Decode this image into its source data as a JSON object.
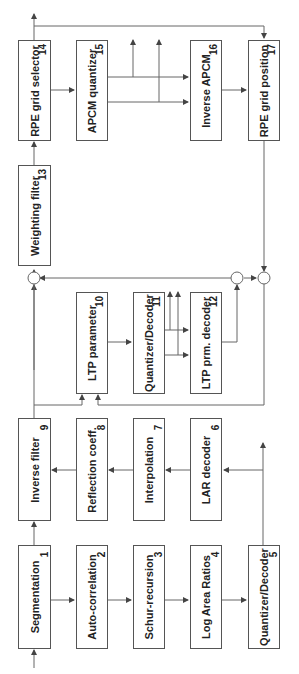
{
  "diagram": {
    "type": "block-diagram",
    "orientation": "rotated-90-ccw",
    "blocks": [
      {
        "id": 1,
        "label": "Segmentation",
        "num": "1"
      },
      {
        "id": 2,
        "label": "Auto-correlation",
        "num": "2"
      },
      {
        "id": 3,
        "label": "Schur-recursion",
        "num": "3"
      },
      {
        "id": 4,
        "label": "Log Area Ratios",
        "num": "4"
      },
      {
        "id": 5,
        "label": "Quantizer/Decoder",
        "num": "5"
      },
      {
        "id": 6,
        "label": "LAR decoder",
        "num": "6"
      },
      {
        "id": 7,
        "label": "Interpolation",
        "num": "7"
      },
      {
        "id": 8,
        "label": "Reflection coeff.",
        "num": "8"
      },
      {
        "id": 9,
        "label": "Inverse filter",
        "num": "9"
      },
      {
        "id": 10,
        "label": "LTP parameter",
        "num": "10"
      },
      {
        "id": 11,
        "label": "Quantizer/Decoder",
        "num": "11"
      },
      {
        "id": 12,
        "label": "LTP prm. decoder",
        "num": "12"
      },
      {
        "id": 13,
        "label": "Weighting filter",
        "num": "13"
      },
      {
        "id": 14,
        "label": "RPE grid selector",
        "num": "14"
      },
      {
        "id": 15,
        "label": "APCM quantizer",
        "num": "15"
      },
      {
        "id": 16,
        "label": "Inverse APCM",
        "num": "16"
      },
      {
        "id": 17,
        "label": "RPE grid position",
        "num": "17"
      }
    ],
    "colors": {
      "line": "#555555",
      "text": "#222222",
      "background": "#ffffff"
    }
  }
}
